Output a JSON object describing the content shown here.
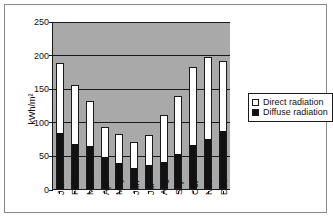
{
  "chart_data": {
    "type": "bar",
    "stacked": true,
    "title": "",
    "xlabel": "",
    "ylabel": "kWh/m²",
    "ylim": [
      0,
      250
    ],
    "yticks": [
      0,
      50,
      100,
      150,
      200,
      250
    ],
    "grid": true,
    "legend_position": "right",
    "categories": [
      "Jan",
      "Feb",
      "Mar",
      "Apr",
      "May",
      "Jun",
      "Jul",
      "Aug",
      "Sep",
      "Oct",
      "Nov",
      "Dec"
    ],
    "series": [
      {
        "name": "Diffuse radiation",
        "color": "#121212",
        "values": [
          84,
          67,
          64,
          48,
          39,
          31,
          35,
          40,
          52,
          65,
          74,
          87
        ]
      },
      {
        "name": "Direct radiation",
        "color": "#ffffff",
        "values": [
          103,
          88,
          67,
          44,
          43,
          39,
          45,
          70,
          86,
          117,
          122,
          104
        ]
      }
    ],
    "totals": [
      187,
      155,
      131,
      92,
      82,
      70,
      80,
      110,
      138,
      182,
      196,
      191
    ]
  },
  "legend": {
    "items": [
      {
        "label": "Direct radiation",
        "swatch": "white-square-icon"
      },
      {
        "label": "Diffuse radiation",
        "swatch": "black-square-icon"
      }
    ]
  },
  "axis": {
    "y_label": "kWh/m²",
    "y_ticks": [
      "0",
      "50",
      "100",
      "150",
      "200",
      "250"
    ],
    "x_ticks": [
      "Jan",
      "Feb",
      "Mar",
      "Apr",
      "May",
      "Jun",
      "Jul",
      "Aug",
      "Sep",
      "Oct",
      "Nov",
      "Dec"
    ]
  },
  "colors": {
    "plot_background": "#a9a9a9",
    "page_background": "#ffffff",
    "axis_line": "#1a1a1a",
    "frame_border": "#8a8a8a"
  }
}
